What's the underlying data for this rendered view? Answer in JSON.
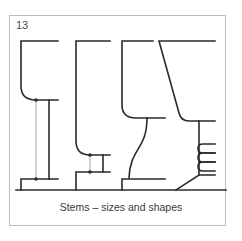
{
  "figure": {
    "number": "13",
    "caption": "Stems – sizes and shapes",
    "stroke_color": "#2a2a2a",
    "thin_line_color": "#6a6a6a",
    "frame_color": "#bdbdbd",
    "shapes": [
      {
        "id": "stem-thin-tall",
        "description": "tall thin stem with dotted measurement line"
      },
      {
        "id": "stem-short-thick",
        "description": "short thick stem with dotted measurement line"
      },
      {
        "id": "stem-curved",
        "description": "S-curved stem"
      },
      {
        "id": "stem-coiled",
        "description": "coiled stem with tapered bowl"
      }
    ]
  }
}
